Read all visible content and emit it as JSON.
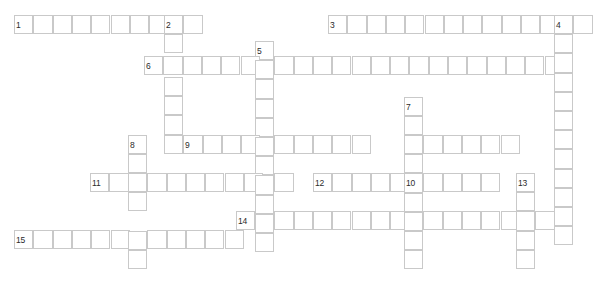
{
  "puzzle": {
    "kind": "crossword-grid",
    "width": 609,
    "height": 285,
    "cell_width": 19.3,
    "cell_height": 19.2,
    "grid_line_color": "#c9c9c9",
    "cell_fill_color": "#ffffff",
    "page_background": "#ffffff",
    "number_color": "#2b2b2b",
    "number_font_size_px": 8.5,
    "total_entries": 15,
    "across_count": 8,
    "down_count": 7
  },
  "entries": [
    {
      "number": "1",
      "direction": "across",
      "length": 10,
      "x": 14,
      "y": 15,
      "label_x": 16,
      "label_y": 21
    },
    {
      "number": "2",
      "direction": "down",
      "length": 8,
      "x": 164,
      "y": 15,
      "label_x": 166,
      "label_y": 21
    },
    {
      "number": "3",
      "direction": "across",
      "length": 14,
      "x": 328,
      "y": 15,
      "label_x": 330,
      "label_y": 21
    },
    {
      "number": "4",
      "direction": "down",
      "length": 13,
      "x": 554,
      "y": 15,
      "label_x": 556,
      "label_y": 21
    },
    {
      "number": "5",
      "direction": "down",
      "length": 11,
      "x": 255,
      "y": 41,
      "label_x": 257,
      "label_y": 47
    },
    {
      "number": "6",
      "direction": "across",
      "length": 21,
      "x": 144,
      "y": 56,
      "label_x": 146,
      "label_y": 62
    },
    {
      "number": "7",
      "direction": "down",
      "length": 10,
      "x": 404,
      "y": 97,
      "label_x": 406,
      "label_y": 103
    },
    {
      "number": "8",
      "direction": "down",
      "length": 8,
      "x": 128,
      "y": 135,
      "label_x": 130,
      "label_y": 141
    },
    {
      "number": "9",
      "direction": "across",
      "length": 10,
      "x": 183,
      "y": 135,
      "label_x": 185,
      "label_y": 141
    },
    {
      "number": "10",
      "direction": "across",
      "length": 6,
      "x": 404,
      "y": 135,
      "label_x": 406,
      "label_y": 141
    },
    {
      "number": "11",
      "direction": "across",
      "length": 11,
      "x": 90,
      "y": 173,
      "label_x": 92,
      "label_y": 179
    },
    {
      "number": "12",
      "direction": "across",
      "length": 10,
      "x": 313,
      "y": 173,
      "label_x": 315,
      "label_y": 179
    },
    {
      "number": "13",
      "direction": "down",
      "length": 5,
      "x": 516,
      "y": 173,
      "label_x": 518,
      "label_y": 179
    },
    {
      "number": "14",
      "direction": "across",
      "length": 16,
      "x": 236,
      "y": 211,
      "label_x": 238,
      "label_y": 217
    },
    {
      "number": "15",
      "direction": "across",
      "length": 12,
      "x": 14,
      "y": 230,
      "label_x": 16,
      "label_y": 236
    }
  ],
  "numbers": [
    {
      "text": "1",
      "x": 16,
      "y": 21
    },
    {
      "text": "2",
      "x": 166,
      "y": 21
    },
    {
      "text": "3",
      "x": 330,
      "y": 21
    },
    {
      "text": "4",
      "x": 556,
      "y": 21
    },
    {
      "text": "5",
      "x": 257,
      "y": 47
    },
    {
      "text": "6",
      "x": 146,
      "y": 62
    },
    {
      "text": "7",
      "x": 406,
      "y": 103
    },
    {
      "text": "8",
      "x": 130,
      "y": 141
    },
    {
      "text": "9",
      "x": 185,
      "y": 141
    },
    {
      "text": "10",
      "x": 406,
      "y": 179
    },
    {
      "text": "11",
      "x": 92,
      "y": 179
    },
    {
      "text": "12",
      "x": 315,
      "y": 179
    },
    {
      "text": "13",
      "x": 518,
      "y": 179
    },
    {
      "text": "14",
      "x": 238,
      "y": 217
    },
    {
      "text": "15",
      "x": 16,
      "y": 236
    }
  ],
  "cells": [
    {
      "x": 14,
      "y": 15,
      "row": "r1",
      "entry": "1-across"
    },
    {
      "x": 33.3,
      "y": 15,
      "row": "r1",
      "entry": "1-across"
    },
    {
      "x": 52.6,
      "y": 15,
      "row": "r1",
      "entry": "1-across"
    },
    {
      "x": 71.9,
      "y": 15,
      "row": "r1",
      "entry": "1-across"
    },
    {
      "x": 91.2,
      "y": 15,
      "row": "r1",
      "entry": "1-across"
    },
    {
      "x": 110.5,
      "y": 15,
      "row": "r1",
      "entry": "1-across"
    },
    {
      "x": 129.8,
      "y": 15,
      "row": "r1",
      "entry": "1-across"
    },
    {
      "x": 149.1,
      "y": 15,
      "row": "r1",
      "entry": "1-across"
    },
    {
      "x": 164.0,
      "y": 15,
      "row": "r1",
      "entry": "1-across/2-down"
    },
    {
      "x": 183.3,
      "y": 15,
      "row": "r1",
      "entry": "1-across"
    },
    {
      "x": 328.0,
      "y": 15,
      "row": "r1",
      "entry": "3-across"
    },
    {
      "x": 347.3,
      "y": 15,
      "row": "r1",
      "entry": "3-across"
    },
    {
      "x": 366.6,
      "y": 15,
      "row": "r1",
      "entry": "3-across"
    },
    {
      "x": 385.9,
      "y": 15,
      "row": "r1",
      "entry": "3-across"
    },
    {
      "x": 405.2,
      "y": 15,
      "row": "r1",
      "entry": "3-across"
    },
    {
      "x": 424.5,
      "y": 15,
      "row": "r1",
      "entry": "3-across"
    },
    {
      "x": 443.8,
      "y": 15,
      "row": "r1",
      "entry": "3-across"
    },
    {
      "x": 463.1,
      "y": 15,
      "row": "r1",
      "entry": "3-across"
    },
    {
      "x": 482.4,
      "y": 15,
      "row": "r1",
      "entry": "3-across"
    },
    {
      "x": 501.7,
      "y": 15,
      "row": "r1",
      "entry": "3-across"
    },
    {
      "x": 521.0,
      "y": 15,
      "row": "r1",
      "entry": "3-across"
    },
    {
      "x": 540.3,
      "y": 15,
      "row": "r1",
      "entry": "3-across"
    },
    {
      "x": 554.0,
      "y": 15,
      "row": "r1",
      "entry": "3-across/4-down"
    },
    {
      "x": 573.3,
      "y": 15,
      "row": "r1",
      "entry": "3-across"
    },
    {
      "x": 164.0,
      "y": 34.2,
      "row": "r2",
      "entry": "2-down"
    },
    {
      "x": 255.0,
      "y": 41,
      "row": "r2",
      "entry": "5-down"
    },
    {
      "x": 554.0,
      "y": 34.2,
      "row": "r2",
      "entry": "4-down"
    },
    {
      "x": 144.0,
      "y": 56,
      "row": "r3",
      "entry": "6-across"
    },
    {
      "x": 163.3,
      "y": 56,
      "row": "r3",
      "entry": "6-across/2-down"
    },
    {
      "x": 182.6,
      "y": 56,
      "row": "r3",
      "entry": "6-across"
    },
    {
      "x": 201.9,
      "y": 56,
      "row": "r3",
      "entry": "6-across"
    },
    {
      "x": 221.2,
      "y": 56,
      "row": "r3",
      "entry": "6-across"
    },
    {
      "x": 240.5,
      "y": 56,
      "row": "r3",
      "entry": "6-across"
    },
    {
      "x": 255.0,
      "y": 60.2,
      "row": "r3",
      "entry": "6-across/5-down"
    },
    {
      "x": 274.3,
      "y": 56,
      "row": "r3",
      "entry": "6-across"
    },
    {
      "x": 293.6,
      "y": 56,
      "row": "r3",
      "entry": "6-across"
    },
    {
      "x": 312.9,
      "y": 56,
      "row": "r3",
      "entry": "6-across"
    },
    {
      "x": 332.2,
      "y": 56,
      "row": "r3",
      "entry": "6-across"
    },
    {
      "x": 351.5,
      "y": 56,
      "row": "r3",
      "entry": "6-across"
    },
    {
      "x": 370.8,
      "y": 56,
      "row": "r3",
      "entry": "6-across"
    },
    {
      "x": 390.1,
      "y": 56,
      "row": "r3",
      "entry": "6-across"
    },
    {
      "x": 409.4,
      "y": 56,
      "row": "r3",
      "entry": "6-across"
    },
    {
      "x": 428.7,
      "y": 56,
      "row": "r3",
      "entry": "6-across"
    },
    {
      "x": 448.0,
      "y": 56,
      "row": "r3",
      "entry": "6-across"
    },
    {
      "x": 467.3,
      "y": 56,
      "row": "r3",
      "entry": "6-across"
    },
    {
      "x": 486.6,
      "y": 56,
      "row": "r3",
      "entry": "6-across"
    },
    {
      "x": 505.9,
      "y": 56,
      "row": "r3",
      "entry": "6-across"
    },
    {
      "x": 525.2,
      "y": 56,
      "row": "r3",
      "entry": "6-across"
    },
    {
      "x": 544.5,
      "y": 56,
      "row": "r3",
      "entry": "6-across"
    },
    {
      "x": 554.0,
      "y": 53.4,
      "row": "r3",
      "entry": "4-down"
    },
    {
      "x": 164.0,
      "y": 77,
      "row": "r4",
      "entry": "2-down"
    },
    {
      "x": 255.0,
      "y": 79.4,
      "row": "r4",
      "entry": "5-down"
    },
    {
      "x": 554.0,
      "y": 72.6,
      "row": "r4",
      "entry": "4-down"
    },
    {
      "x": 164.0,
      "y": 96.2,
      "row": "r5",
      "entry": "2-down"
    },
    {
      "x": 255.0,
      "y": 98.6,
      "row": "r5",
      "entry": "5-down"
    },
    {
      "x": 404.0,
      "y": 97,
      "row": "r5",
      "entry": "7-down"
    },
    {
      "x": 554.0,
      "y": 91.8,
      "row": "r5",
      "entry": "4-down"
    },
    {
      "x": 164.0,
      "y": 115.4,
      "row": "r6",
      "entry": "2-down"
    },
    {
      "x": 255.0,
      "y": 117.8,
      "row": "r6",
      "entry": "5-down"
    },
    {
      "x": 404.0,
      "y": 116.2,
      "row": "r6",
      "entry": "7-down"
    },
    {
      "x": 554.0,
      "y": 111.0,
      "row": "r6",
      "entry": "4-down"
    },
    {
      "x": 128.0,
      "y": 135,
      "row": "r7",
      "entry": "8-down"
    },
    {
      "x": 183.3,
      "y": 135,
      "row": "r7",
      "entry": "9-across"
    },
    {
      "x": 202.6,
      "y": 135,
      "row": "r7",
      "entry": "9-across"
    },
    {
      "x": 221.9,
      "y": 135,
      "row": "r7",
      "entry": "9-across"
    },
    {
      "x": 241.2,
      "y": 135,
      "row": "r7",
      "entry": "9-across"
    },
    {
      "x": 255.0,
      "y": 137.0,
      "row": "r7",
      "entry": "9-across/5-down"
    },
    {
      "x": 274.3,
      "y": 135,
      "row": "r7",
      "entry": "9-across"
    },
    {
      "x": 293.6,
      "y": 135,
      "row": "r7",
      "entry": "9-across"
    },
    {
      "x": 312.9,
      "y": 135,
      "row": "r7",
      "entry": "9-across"
    },
    {
      "x": 332.2,
      "y": 135,
      "row": "r7",
      "entry": "9-across"
    },
    {
      "x": 351.5,
      "y": 135,
      "row": "r7",
      "entry": "9-across"
    },
    {
      "x": 404.0,
      "y": 135,
      "row": "r7",
      "entry": "10-across/7-down"
    },
    {
      "x": 423.3,
      "y": 135,
      "row": "r7",
      "entry": "10-across"
    },
    {
      "x": 442.6,
      "y": 135,
      "row": "r7",
      "entry": "10-across"
    },
    {
      "x": 461.9,
      "y": 135,
      "row": "r7",
      "entry": "10-across"
    },
    {
      "x": 481.2,
      "y": 135,
      "row": "r7",
      "entry": "10-across"
    },
    {
      "x": 500.5,
      "y": 135,
      "row": "r7",
      "entry": "10-across"
    },
    {
      "x": 554.0,
      "y": 130.2,
      "row": "r7",
      "entry": "4-down"
    },
    {
      "x": 128.0,
      "y": 154.2,
      "row": "r8",
      "entry": "8-down"
    },
    {
      "x": 164.0,
      "y": 134.6,
      "row": "r8",
      "entry": "2-down"
    },
    {
      "x": 255.0,
      "y": 156.2,
      "row": "r8",
      "entry": "5-down"
    },
    {
      "x": 404.0,
      "y": 154.2,
      "row": "r8",
      "entry": "7-down"
    },
    {
      "x": 554.0,
      "y": 149.4,
      "row": "r8",
      "entry": "4-down"
    },
    {
      "x": 90.0,
      "y": 173,
      "row": "r9",
      "entry": "11-across"
    },
    {
      "x": 109.3,
      "y": 173,
      "row": "r9",
      "entry": "11-across"
    },
    {
      "x": 128.0,
      "y": 173,
      "row": "r9",
      "entry": "11-across/8-down"
    },
    {
      "x": 147.3,
      "y": 173,
      "row": "r9",
      "entry": "11-across"
    },
    {
      "x": 166.6,
      "y": 173,
      "row": "r9",
      "entry": "11-across"
    },
    {
      "x": 185.9,
      "y": 173,
      "row": "r9",
      "entry": "11-across"
    },
    {
      "x": 205.2,
      "y": 173,
      "row": "r9",
      "entry": "11-across"
    },
    {
      "x": 224.5,
      "y": 173,
      "row": "r9",
      "entry": "11-across"
    },
    {
      "x": 243.8,
      "y": 173,
      "row": "r9",
      "entry": "11-across"
    },
    {
      "x": 255.0,
      "y": 175.4,
      "row": "r9",
      "entry": "11-across/5-down"
    },
    {
      "x": 274.3,
      "y": 173,
      "row": "r9",
      "entry": "11-across"
    },
    {
      "x": 313.0,
      "y": 173,
      "row": "r9",
      "entry": "12-across"
    },
    {
      "x": 332.3,
      "y": 173,
      "row": "r9",
      "entry": "12-across"
    },
    {
      "x": 351.6,
      "y": 173,
      "row": "r9",
      "entry": "12-across"
    },
    {
      "x": 370.9,
      "y": 173,
      "row": "r9",
      "entry": "12-across"
    },
    {
      "x": 390.2,
      "y": 173,
      "row": "r9",
      "entry": "12-across"
    },
    {
      "x": 404.0,
      "y": 173.4,
      "row": "r9",
      "entry": "12-across/7-down"
    },
    {
      "x": 423.3,
      "y": 173,
      "row": "r9",
      "entry": "12-across"
    },
    {
      "x": 442.6,
      "y": 173,
      "row": "r9",
      "entry": "12-across"
    },
    {
      "x": 461.9,
      "y": 173,
      "row": "r9",
      "entry": "12-across"
    },
    {
      "x": 481.2,
      "y": 173,
      "row": "r9",
      "entry": "12-across"
    },
    {
      "x": 516.0,
      "y": 173,
      "row": "r9",
      "entry": "13-down"
    },
    {
      "x": 554.0,
      "y": 168.6,
      "row": "r9",
      "entry": "4-down"
    },
    {
      "x": 128.0,
      "y": 192.2,
      "row": "r10",
      "entry": "8-down"
    },
    {
      "x": 255.0,
      "y": 194.6,
      "row": "r10",
      "entry": "5-down"
    },
    {
      "x": 404.0,
      "y": 192.6,
      "row": "r10",
      "entry": "7-down"
    },
    {
      "x": 516.0,
      "y": 192.2,
      "row": "r10",
      "entry": "13-down"
    },
    {
      "x": 554.0,
      "y": 187.8,
      "row": "r10",
      "entry": "4-down"
    },
    {
      "x": 236.0,
      "y": 211,
      "row": "r11",
      "entry": "14-across"
    },
    {
      "x": 255.0,
      "y": 213.8,
      "row": "r11",
      "entry": "14-across/5-down"
    },
    {
      "x": 274.3,
      "y": 211,
      "row": "r11",
      "entry": "14-across"
    },
    {
      "x": 293.6,
      "y": 211,
      "row": "r11",
      "entry": "14-across"
    },
    {
      "x": 312.9,
      "y": 211,
      "row": "r11",
      "entry": "14-across"
    },
    {
      "x": 332.2,
      "y": 211,
      "row": "r11",
      "entry": "14-across"
    },
    {
      "x": 351.5,
      "y": 211,
      "row": "r11",
      "entry": "14-across"
    },
    {
      "x": 370.8,
      "y": 211,
      "row": "r11",
      "entry": "14-across"
    },
    {
      "x": 390.1,
      "y": 211,
      "row": "r11",
      "entry": "14-across"
    },
    {
      "x": 404.0,
      "y": 211.8,
      "row": "r11",
      "entry": "14-across/7-down"
    },
    {
      "x": 423.3,
      "y": 211,
      "row": "r11",
      "entry": "14-across"
    },
    {
      "x": 442.6,
      "y": 211,
      "row": "r11",
      "entry": "14-across"
    },
    {
      "x": 461.9,
      "y": 211,
      "row": "r11",
      "entry": "14-across"
    },
    {
      "x": 481.2,
      "y": 211,
      "row": "r11",
      "entry": "14-across"
    },
    {
      "x": 500.5,
      "y": 211,
      "row": "r11",
      "entry": "14-across"
    },
    {
      "x": 516.0,
      "y": 211.4,
      "row": "r11",
      "entry": "14-across/13-down"
    },
    {
      "x": 535.3,
      "y": 211,
      "row": "r11",
      "entry": "14-across"
    },
    {
      "x": 554.0,
      "y": 207.0,
      "row": "r11",
      "entry": "4-down"
    },
    {
      "x": 14.0,
      "y": 230,
      "row": "r12",
      "entry": "15-across"
    },
    {
      "x": 33.3,
      "y": 230,
      "row": "r12",
      "entry": "15-across"
    },
    {
      "x": 52.6,
      "y": 230,
      "row": "r12",
      "entry": "15-across"
    },
    {
      "x": 71.9,
      "y": 230,
      "row": "r12",
      "entry": "15-across"
    },
    {
      "x": 91.2,
      "y": 230,
      "row": "r12",
      "entry": "15-across"
    },
    {
      "x": 110.5,
      "y": 230,
      "row": "r12",
      "entry": "15-across"
    },
    {
      "x": 128.0,
      "y": 230.6,
      "row": "r12",
      "entry": "15-across/8-down"
    },
    {
      "x": 147.3,
      "y": 230,
      "row": "r12",
      "entry": "15-across"
    },
    {
      "x": 166.6,
      "y": 230,
      "row": "r12",
      "entry": "15-across"
    },
    {
      "x": 185.9,
      "y": 230,
      "row": "r12",
      "entry": "15-across"
    },
    {
      "x": 205.2,
      "y": 230,
      "row": "r12",
      "entry": "15-across"
    },
    {
      "x": 224.5,
      "y": 230,
      "row": "r12",
      "entry": "15-across"
    },
    {
      "x": 255.0,
      "y": 233.0,
      "row": "r12",
      "entry": "5-down"
    },
    {
      "x": 404.0,
      "y": 231.0,
      "row": "r12",
      "entry": "7-down"
    },
    {
      "x": 516.0,
      "y": 230.6,
      "row": "r12",
      "entry": "13-down"
    },
    {
      "x": 554.0,
      "y": 226.2,
      "row": "r12",
      "entry": "4-down"
    },
    {
      "x": 128.0,
      "y": 249.8,
      "row": "r13",
      "entry": "8-down"
    },
    {
      "x": 404.0,
      "y": 250.2,
      "row": "r13",
      "entry": "7-down"
    },
    {
      "x": 516.0,
      "y": 249.8,
      "row": "r13",
      "entry": "13-down"
    }
  ]
}
